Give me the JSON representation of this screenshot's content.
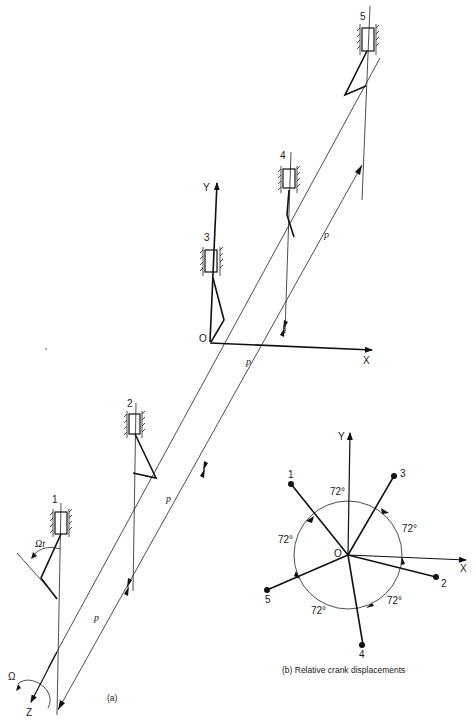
{
  "figure": {
    "panel_a": {
      "caption": "(a)",
      "axis_labels": {
        "x": "X",
        "y": "Y",
        "z": "Z",
        "origin": "O"
      },
      "rotation_label": "Ω",
      "angle_label": "Ωt",
      "pitch_label": "p",
      "cylinders": [
        {
          "id": "1",
          "label": "1"
        },
        {
          "id": "2",
          "label": "2"
        },
        {
          "id": "3",
          "label": "3"
        },
        {
          "id": "4",
          "label": "4"
        },
        {
          "id": "5",
          "label": "5"
        }
      ]
    },
    "panel_b": {
      "caption": "(b) Relative crank displacements",
      "axis_labels": {
        "x": "X",
        "y": "Y",
        "origin": "O"
      },
      "angle_label": "72°",
      "cranks": [
        {
          "id": "1",
          "label": "1"
        },
        {
          "id": "2",
          "label": "2"
        },
        {
          "id": "3",
          "label": "3"
        },
        {
          "id": "4",
          "label": "4"
        },
        {
          "id": "5",
          "label": "5"
        }
      ]
    }
  }
}
